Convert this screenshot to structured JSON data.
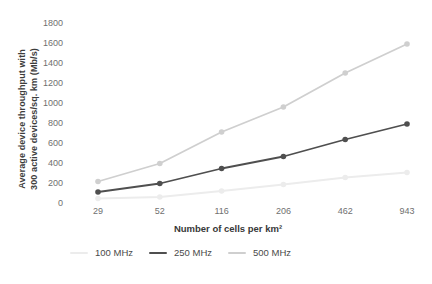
{
  "y_axis": {
    "title_line1": "Average device throughput with",
    "title_line2": "300 active devices/sq. km (Mb/s)"
  },
  "x_axis": {
    "title": "Number of cells per km²"
  },
  "colors": {
    "tick_label": "#707070",
    "axis_title": "#3d3d3d",
    "series_100mhz": "#ececec",
    "series_250mhz": "#4f4f4f",
    "series_500mhz": "#cfcfcf"
  },
  "chart_data": {
    "type": "line",
    "title": "",
    "xlabel": "Number of cells per km²",
    "ylabel": "Average device throughput with 300 active devices/sq. km (Mb/s)",
    "categories": [
      "29",
      "52",
      "116",
      "206",
      "462",
      "943"
    ],
    "yticks": [
      0,
      200,
      400,
      600,
      800,
      1000,
      1200,
      1400,
      1600,
      1800
    ],
    "ylim": [
      0,
      1800
    ],
    "grid": false,
    "legend_position": "bottom-left",
    "marker": "circle",
    "series": [
      {
        "name": "100 MHz",
        "color": "#ececec",
        "values": [
          45,
          60,
          120,
          185,
          255,
          305
        ]
      },
      {
        "name": "500 MHz",
        "color": "#cfcfcf",
        "values": [
          215,
          395,
          710,
          960,
          1300,
          1590
        ]
      },
      {
        "name": "250 MHz",
        "color": "#4f4f4f",
        "values": [
          110,
          195,
          345,
          465,
          635,
          790
        ]
      }
    ],
    "legend_order": [
      "100 MHz",
      "250 MHz",
      "500 MHz"
    ]
  }
}
